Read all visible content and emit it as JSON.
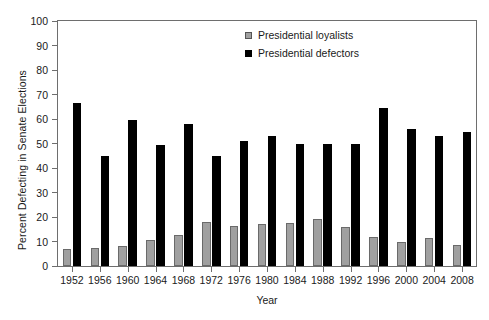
{
  "chart_data": {
    "type": "bar",
    "title": "",
    "xlabel": "Year",
    "ylabel": "Percent Defecting in Senate Elections",
    "ylim": [
      0,
      100
    ],
    "ytick_step": 10,
    "yticks": [
      0,
      10,
      20,
      30,
      40,
      50,
      60,
      70,
      80,
      90,
      100
    ],
    "grid": false,
    "legend_position": "top-center",
    "categories": [
      "1952",
      "1956",
      "1960",
      "1964",
      "1968",
      "1972",
      "1976",
      "1980",
      "1984",
      "1988",
      "1992",
      "1996",
      "2000",
      "2004",
      "2008"
    ],
    "series": [
      {
        "name": "Presidential loyalists",
        "color": "#a0a0a0",
        "values": [
          7,
          7.5,
          8,
          10.5,
          12.5,
          18,
          16.5,
          17,
          17.5,
          19,
          16,
          12,
          10,
          11.5,
          8.5
        ]
      },
      {
        "name": "Presidential defectors",
        "color": "#000000",
        "values": [
          66.5,
          45,
          59.5,
          49.5,
          58,
          45,
          51,
          53,
          50,
          50,
          50,
          64.5,
          56,
          53,
          54.5
        ]
      }
    ]
  }
}
